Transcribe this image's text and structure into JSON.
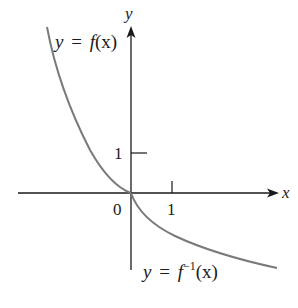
{
  "figure": {
    "axes": {
      "x_label": "x",
      "y_label": "y",
      "origin_label": "0",
      "x_tick_label": "1",
      "y_tick_label": "1"
    },
    "curves": [
      {
        "name": "f",
        "label_lhs": "y",
        "label_eq": "=",
        "label_rhs_fn": "f",
        "label_rhs_sup": "",
        "label_rhs_arg": "(x)"
      },
      {
        "name": "f-inverse",
        "label_lhs": "y",
        "label_eq": "=",
        "label_rhs_fn": "f",
        "label_rhs_sup": "−1",
        "label_rhs_arg": "(x)"
      }
    ],
    "colors": {
      "axis": "#1a1a1a",
      "curve": "#7a7a7a",
      "background": "#ffffff"
    }
  }
}
